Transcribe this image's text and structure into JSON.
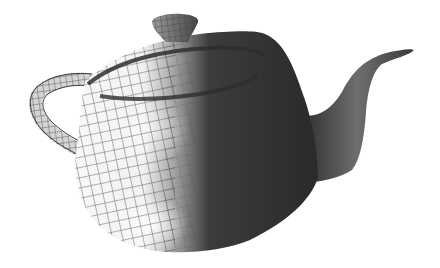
{
  "image": {
    "subject": "Utah teapot rendering, half wireframe mesh and half smooth shaded",
    "background": "#ffffff",
    "colors": {
      "shaded_dark": "#2e2e2e",
      "shaded_mid": "#555555",
      "highlight": "#f4f4f4",
      "wire": "#3a3a3a",
      "spout_mid": "#6a6a6a"
    }
  }
}
